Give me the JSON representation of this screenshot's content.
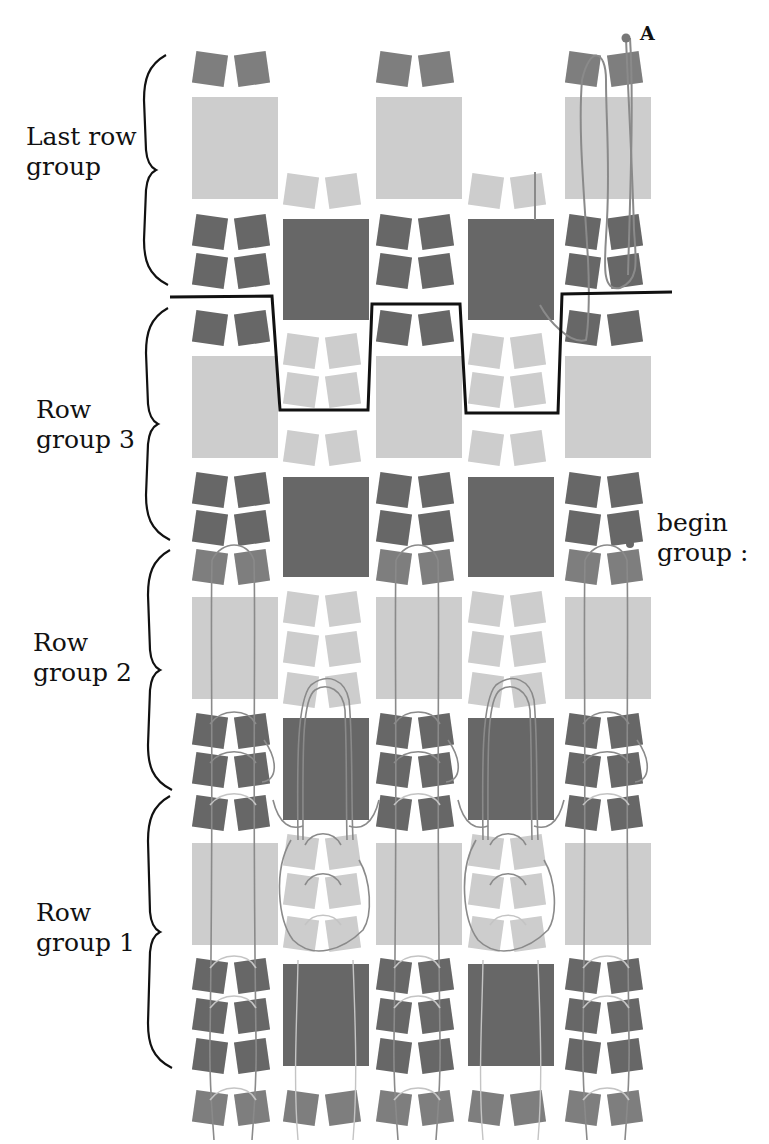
{
  "labels": {
    "last_row_group": [
      "Last row",
      "group"
    ],
    "row_group_3": [
      "Row",
      "group 3"
    ],
    "row_group_2": [
      "Row",
      "group 2"
    ],
    "row_group_1": [
      "Row",
      "group 1"
    ],
    "begin_group": [
      "begin",
      "group :"
    ],
    "point_a": "A"
  },
  "colors": {
    "dark_tile": "#676767",
    "medium_tile": "#7e7e7e",
    "light_tile": "#cdcdcd",
    "thread": "#8a8a8a",
    "faint_thread": "#c4c4c4",
    "outline": "#111111",
    "background": "#ffffff"
  },
  "grid": {
    "big_columns": [
      192,
      376,
      565
    ],
    "small_columns": [
      283,
      468
    ],
    "big_width": 86,
    "small_width": 86
  },
  "row_groups": [
    {
      "name": "Last row group",
      "top": 45,
      "bottom": 290
    },
    {
      "name": "Row group 3",
      "top": 310,
      "bottom": 545
    },
    {
      "name": "Row group 2",
      "top": 555,
      "bottom": 790
    },
    {
      "name": "Row group 1",
      "top": 800,
      "bottom": 1060
    }
  ]
}
